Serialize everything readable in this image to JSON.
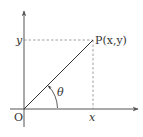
{
  "diagram": {
    "type": "coordinate-plane-angle",
    "labels": {
      "origin": "O",
      "x_tick": "x",
      "y_tick": "y",
      "point": "P(x,y)",
      "angle": "θ"
    },
    "colors": {
      "axis": "#555555",
      "segment": "#333333",
      "dashed": "#888888",
      "text": "#333333"
    }
  }
}
